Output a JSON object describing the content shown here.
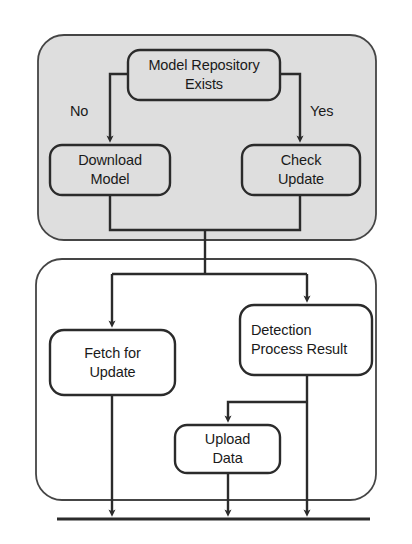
{
  "diagram": {
    "type": "flowchart",
    "colors": {
      "stroke": "#2b2b2b",
      "group_fill_grey": "#dedede",
      "group_fill_white": "#ffffff",
      "node_fill": "#ffffff",
      "text": "#1a1a1a"
    },
    "groups": [
      {
        "id": "group-model-setup",
        "name": "model-setup-group",
        "fill": "grey",
        "x": 38,
        "y": 35,
        "w": 338,
        "h": 205,
        "r": 26
      },
      {
        "id": "group-detection",
        "name": "detection-group",
        "fill": "white",
        "x": 36,
        "y": 259,
        "w": 340,
        "h": 241,
        "r": 26
      }
    ],
    "nodes": [
      {
        "id": "node-model-repository-exists",
        "name": "model-repository-exists",
        "lines": [
          "Model Repository",
          "Exists"
        ],
        "x": 128,
        "y": 50,
        "w": 152,
        "h": 50,
        "r": 12
      },
      {
        "id": "node-download-model",
        "name": "download-model",
        "lines": [
          "Download",
          "Model"
        ],
        "x": 50,
        "y": 145,
        "w": 120,
        "h": 50,
        "r": 12
      },
      {
        "id": "node-check-update",
        "name": "check-update",
        "lines": [
          "Check",
          "Update"
        ],
        "x": 242,
        "y": 145,
        "w": 118,
        "h": 50,
        "r": 12
      },
      {
        "id": "node-fetch-for-update",
        "name": "fetch-for-update",
        "lines": [
          "Fetch for",
          "Update"
        ],
        "x": 50,
        "y": 330,
        "w": 125,
        "h": 65,
        "r": 14
      },
      {
        "id": "node-detection-process-result",
        "name": "detection-process-result",
        "lines": [
          "Detection",
          "Process Result"
        ],
        "x": 240,
        "y": 305,
        "w": 132,
        "h": 70,
        "r": 14
      },
      {
        "id": "node-upload-data",
        "name": "upload-data",
        "lines": [
          "Upload",
          "Data"
        ],
        "x": 175,
        "y": 425,
        "w": 105,
        "h": 48,
        "r": 12
      }
    ],
    "edge_labels": [
      {
        "id": "label-no",
        "name": "edge-label-no",
        "text": "No",
        "x": 70,
        "y": 104
      },
      {
        "id": "label-yes",
        "name": "edge-label-yes",
        "text": "Yes",
        "x": 310,
        "y": 104
      }
    ],
    "terminator": {
      "id": "terminator-bar",
      "name": "terminator-bar",
      "x1": 57,
      "x2": 370,
      "y": 519
    }
  }
}
